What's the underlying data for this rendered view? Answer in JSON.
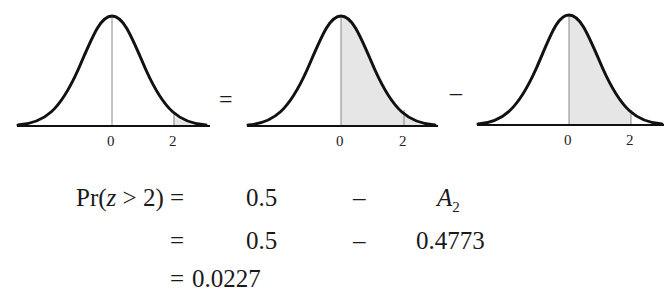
{
  "diagram": {
    "panels": [
      {
        "id": "tail",
        "shade": "z > 2",
        "ticks": [
          "0",
          "2"
        ]
      },
      {
        "id": "half",
        "shade": "z > 0",
        "ticks": [
          "0",
          "2"
        ]
      },
      {
        "id": "a2",
        "shade": "0 < z < 2",
        "ticks": [
          "0",
          "2"
        ]
      }
    ],
    "operators": {
      "equals": "=",
      "minus": "–"
    },
    "shade_color": "#e6e6e6",
    "curve_color": "#111111"
  },
  "equations": {
    "row1": {
      "lhs_pre": "Pr(",
      "lhs_var": "z",
      "lhs_post": " > 2)",
      "eq": "=",
      "term1": "0.5",
      "op": "–",
      "term2_var": "A",
      "term2_sub": "2"
    },
    "row2": {
      "eq": "=",
      "term1": "0.5",
      "op": "–",
      "term2": "0.4773"
    },
    "row3": {
      "eq": "=",
      "result": "0.0227"
    }
  }
}
